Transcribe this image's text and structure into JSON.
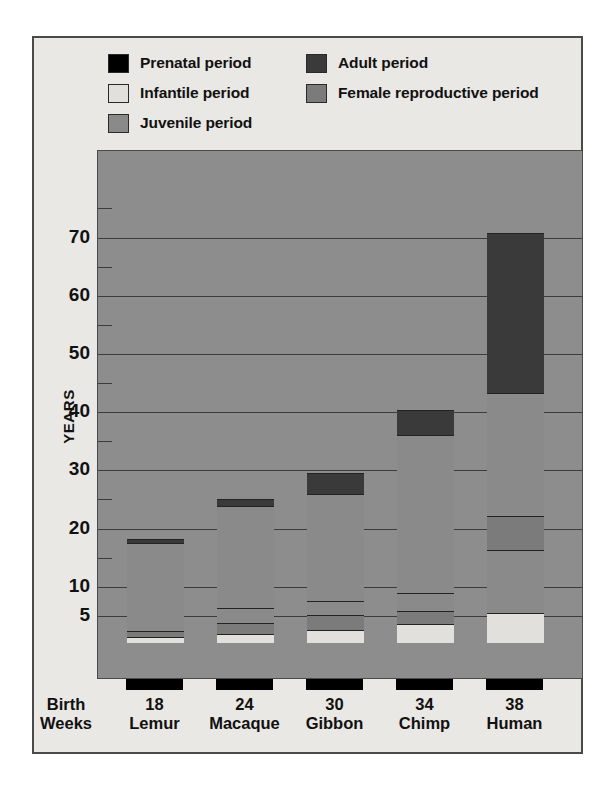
{
  "legend": {
    "columns": [
      [
        {
          "label": "Prenatal period",
          "color": "#000000",
          "key": "prenatal"
        },
        {
          "label": "Infantile period",
          "color": "#e2e0dc",
          "key": "infantile"
        },
        {
          "label": "Juvenile period",
          "color": "#8a8a8a",
          "key": "juvenile"
        }
      ],
      [
        {
          "label": "Adult period",
          "color": "#3a3a3a",
          "key": "adult"
        },
        {
          "label": "Female reproductive period",
          "color": "#7b7b7b",
          "key": "female_reproductive"
        }
      ]
    ]
  },
  "axes": {
    "y_title": "YEARS",
    "y_ticks": [
      5,
      10,
      20,
      30,
      40,
      50,
      60,
      70
    ],
    "y_tick_labels": [
      "5",
      "10",
      "20",
      "30",
      "40",
      "50",
      "60",
      "70"
    ],
    "y_minor_ticks": [
      15,
      25,
      35,
      45,
      55,
      65,
      75
    ],
    "y_min": 0,
    "y_max": 78,
    "x_header_line1": "Birth",
    "x_header_line2": "Weeks"
  },
  "chart_data": {
    "type": "bar",
    "subtype": "stacked-bar",
    "title": "",
    "xlabel": "Birth Weeks",
    "ylabel": "YEARS",
    "ylim": [
      0,
      78
    ],
    "grid": true,
    "legend_position": "top",
    "categories": [
      "Lemur",
      "Macaque",
      "Gibbon",
      "Chimp",
      "Human"
    ],
    "gestation_weeks": [
      18,
      24,
      30,
      34,
      38
    ],
    "stack_order": [
      "prenatal",
      "infantile",
      "female_reproductive",
      "juvenile",
      "adult"
    ],
    "series": [
      {
        "name": "Prenatal period",
        "key": "prenatal",
        "color": "#000000",
        "values": [
          -1.7,
          -1.7,
          -1.7,
          -1.7,
          -1.7
        ]
      },
      {
        "name": "Infantile period",
        "key": "infantile",
        "color": "#e2e0dc",
        "values": [
          1.0,
          1.6,
          2.2,
          3.3,
          5.2
        ]
      },
      {
        "name": "Female reproductive period",
        "key": "female_reproductive",
        "color": "#7b7b7b",
        "values": [
          1.0,
          1.8,
          2.6,
          2.2,
          0.0
        ]
      },
      {
        "name": "Juvenile period",
        "key": "juvenile",
        "color": "#8a8a8a",
        "values": [
          15.2,
          20.2,
          20.8,
          30.2,
          37.8
        ]
      },
      {
        "name": "Adult period",
        "key": "adult",
        "color": "#3a3a3a",
        "values": [
          0.7,
          1.2,
          3.6,
          4.3,
          27.5
        ]
      }
    ],
    "bar_totals": [
      17.9,
      24.8,
      29.2,
      40.0,
      70.5
    ],
    "bars": [
      {
        "category": "Lemur",
        "weeks": 18,
        "total": 17.9,
        "segments": [
          {
            "key": "prenatal",
            "from": -1.7,
            "to": 0.0
          },
          {
            "key": "infantile",
            "from": 0.0,
            "to": 1.0
          },
          {
            "key": "female_reproductive",
            "from": 1.0,
            "to": 2.0
          },
          {
            "key": "juvenile",
            "from": 2.0,
            "to": 17.2
          },
          {
            "key": "adult",
            "from": 17.2,
            "to": 17.9
          }
        ]
      },
      {
        "category": "Macaque",
        "weeks": 24,
        "total": 24.8,
        "segments": [
          {
            "key": "prenatal",
            "from": -1.7,
            "to": 0.0
          },
          {
            "key": "infantile",
            "from": 0.0,
            "to": 1.6
          },
          {
            "key": "female_reproductive",
            "from": 1.6,
            "to": 3.4
          },
          {
            "key": "juvenile",
            "from": 3.4,
            "to": 6.0
          },
          {
            "key": "juvenile",
            "from": 6.0,
            "to": 23.6
          },
          {
            "key": "adult",
            "from": 23.6,
            "to": 24.8
          }
        ]
      },
      {
        "category": "Gibbon",
        "weeks": 30,
        "total": 29.2,
        "segments": [
          {
            "key": "prenatal",
            "from": -1.7,
            "to": 0.0
          },
          {
            "key": "infantile",
            "from": 0.0,
            "to": 2.2
          },
          {
            "key": "female_reproductive",
            "from": 2.2,
            "to": 4.8
          },
          {
            "key": "juvenile",
            "from": 4.8,
            "to": 7.3
          },
          {
            "key": "juvenile",
            "from": 7.3,
            "to": 25.6
          },
          {
            "key": "adult",
            "from": 25.6,
            "to": 29.2
          }
        ]
      },
      {
        "category": "Chimp",
        "weeks": 34,
        "total": 40.0,
        "segments": [
          {
            "key": "prenatal",
            "from": -1.7,
            "to": 0.0
          },
          {
            "key": "infantile",
            "from": 0.0,
            "to": 3.3
          },
          {
            "key": "female_reproductive",
            "from": 3.3,
            "to": 5.5
          },
          {
            "key": "juvenile",
            "from": 5.5,
            "to": 8.6
          },
          {
            "key": "juvenile",
            "from": 8.6,
            "to": 35.7
          },
          {
            "key": "adult",
            "from": 35.7,
            "to": 40.0
          }
        ]
      },
      {
        "category": "Human",
        "weeks": 38,
        "total": 70.5,
        "segments": [
          {
            "key": "prenatal",
            "from": -1.7,
            "to": 0.0
          },
          {
            "key": "infantile",
            "from": 0.0,
            "to": 5.2
          },
          {
            "key": "juvenile",
            "from": 5.2,
            "to": 15.9
          },
          {
            "key": "female_reproductive",
            "from": 15.9,
            "to": 21.8
          },
          {
            "key": "juvenile",
            "from": 21.8,
            "to": 43.0
          },
          {
            "key": "adult",
            "from": 43.0,
            "to": 70.5
          }
        ]
      }
    ]
  }
}
